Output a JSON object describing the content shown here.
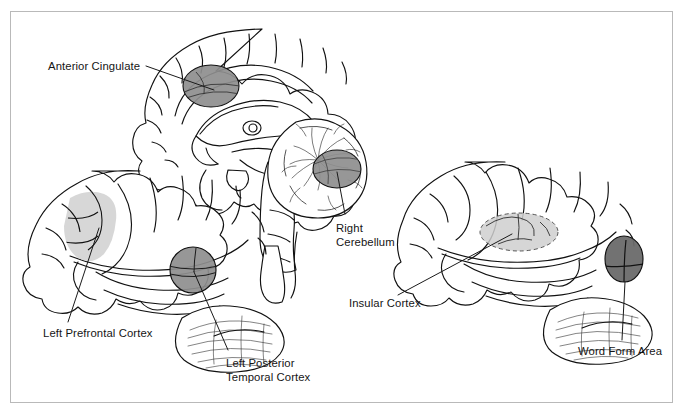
{
  "figure": {
    "kind": "anatomical-diagram",
    "background_color": "#ffffff",
    "border_color": "#b9b9b9",
    "views": [
      {
        "name": "midsagittal-brain",
        "position": "top-center"
      },
      {
        "name": "left-lateral-brain",
        "position": "bottom-left"
      },
      {
        "name": "right-lateral-brain",
        "position": "right"
      }
    ],
    "palette": {
      "outline": "#111111",
      "shade_dark": "#6a6a6a",
      "shade_medium": "#8e8e8e",
      "shade_light": "#d5d5d5",
      "leader_line": "#1a1a1a"
    }
  },
  "labels": [
    {
      "id": "anterior-cingulate",
      "text": "Anterior Cingulate",
      "lines": [
        "Anterior Cingulate"
      ],
      "view": "midsagittal-brain",
      "region_shade": "#8e8e8e"
    },
    {
      "id": "right-cerebellum",
      "text": "Right Cerebellum",
      "lines": [
        "Right",
        "Cerebellum"
      ],
      "view": "midsagittal-brain",
      "region_shade": "#8e8e8e"
    },
    {
      "id": "left-prefrontal-cortex",
      "text": "Left Prefrontal Cortex",
      "lines": [
        "Left Prefrontal Cortex"
      ],
      "view": "left-lateral-brain",
      "region_shade": "#d5d5d5"
    },
    {
      "id": "left-posterior-temporal-cortex",
      "text": "Left Posterior Temporal Cortex",
      "lines": [
        "Left Posterior",
        "Temporal Cortex"
      ],
      "view": "left-lateral-brain",
      "region_shade": "#8e8e8e"
    },
    {
      "id": "insular-cortex",
      "text": "Insular Cortex",
      "lines": [
        "Insular Cortex"
      ],
      "view": "right-lateral-brain",
      "region_shade": "#d5d5d5"
    },
    {
      "id": "word-form-area",
      "text": "Word Form Area",
      "lines": [
        "Word Form Area"
      ],
      "view": "right-lateral-brain",
      "region_shade": "#6a6a6a"
    }
  ]
}
